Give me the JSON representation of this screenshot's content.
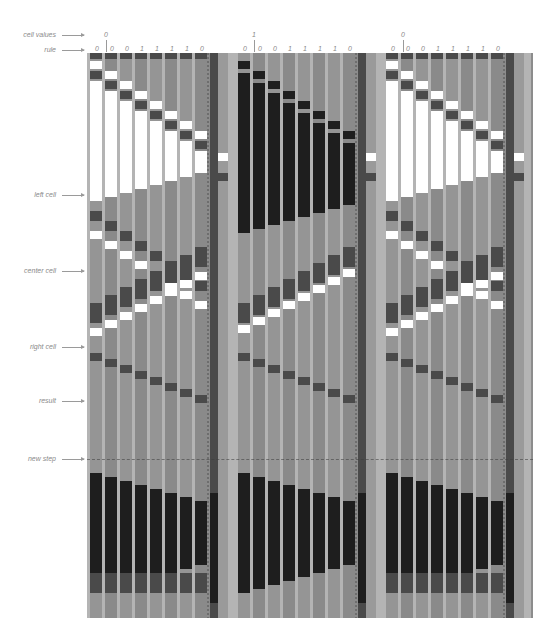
{
  "labels": [
    {
      "text": "cell values",
      "y": 35
    },
    {
      "text": "rule",
      "y": 50
    },
    {
      "text": "left cell",
      "y": 195
    },
    {
      "text": "center cell",
      "y": 271
    },
    {
      "text": "right cell",
      "y": 347
    },
    {
      "text": "result",
      "y": 401
    },
    {
      "text": "new step",
      "y": 459
    }
  ],
  "blocks": [
    {
      "x": 87,
      "cell_value": "0",
      "cell_value_x": 104,
      "rule_bits": [
        "0",
        "0",
        "0",
        "1",
        "1",
        "1",
        "1",
        "0"
      ]
    },
    {
      "x": 235,
      "cell_value": "1",
      "cell_value_x": 252,
      "rule_bits": [
        "0",
        "0",
        "0",
        "1",
        "1",
        "1",
        "1",
        "0"
      ]
    },
    {
      "x": 383,
      "cell_value": "0",
      "cell_value_x": 401,
      "rule_bits": [
        "0",
        "0",
        "0",
        "1",
        "1",
        "1",
        "1",
        "0"
      ]
    }
  ],
  "rule_bit_offsets": [
    10,
    25,
    40,
    55,
    70,
    85,
    100,
    115
  ],
  "new_step_line_y": 459,
  "colors": {
    "background": "#ffffff",
    "figure_mid": "#8c8c8c",
    "white": "#ffffff",
    "light": "#b4b4b4",
    "mid": "#8c8c8c",
    "dark": "#4a4a4a",
    "black": "#1e1e1e",
    "label": "#8a8a8a"
  }
}
